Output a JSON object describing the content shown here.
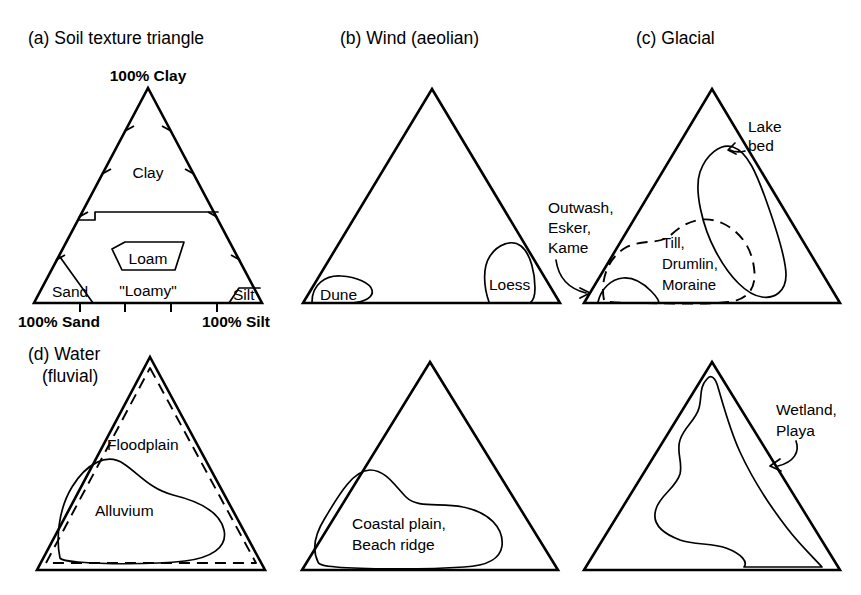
{
  "figure": {
    "background_color": "#ffffff",
    "line_color": "#000000",
    "type": "ternary-diagram-grid",
    "rows": 2,
    "columns": 3
  },
  "panels": {
    "a": {
      "title": "(a) Soil texture triangle",
      "apex_label": "100% Clay",
      "left_axis_label": "100% Sand",
      "right_axis_label": "100% Silt",
      "regions": [
        {
          "name": "clay",
          "label": "Clay"
        },
        {
          "name": "loam",
          "label": "Loam"
        },
        {
          "name": "loamy",
          "label": "\"Loamy\""
        },
        {
          "name": "sand",
          "label": "Sand"
        },
        {
          "name": "silt",
          "label": "Silt"
        }
      ],
      "tick_count_per_side": 4
    },
    "b": {
      "title": "(b) Wind (aeolian)",
      "regions": [
        {
          "name": "dune",
          "label": "Dune"
        },
        {
          "name": "loess",
          "label": "Loess"
        }
      ]
    },
    "c": {
      "title": "(c)  Glacial",
      "regions": [
        {
          "name": "lake-bed",
          "label": "Lake\nbed",
          "label_line_1": "Lake",
          "label_line_2": "bed",
          "style": "solid",
          "annotated": true
        },
        {
          "name": "outwash-esker-kame",
          "label_line_1": "Outwash,",
          "label_line_2": "Esker,",
          "label_line_3": "Kame",
          "style": "solid",
          "annotated": true
        },
        {
          "name": "till-drumlin-moraine",
          "label_line_1": "Till,",
          "label_line_2": "Drumlin,",
          "label_line_3": "Moraine",
          "style": "dashed",
          "annotated": false
        }
      ]
    },
    "d": {
      "title_line_1": "(d) Water",
      "title_line_2": "(fluvial)",
      "regions": [
        {
          "name": "floodplain",
          "label": "Floodplain",
          "style": "dashed"
        },
        {
          "name": "alluvium",
          "label": "Alluvium",
          "style": "solid"
        }
      ]
    },
    "e": {
      "title": "",
      "regions": [
        {
          "name": "coastal-plain-beach-ridge",
          "label_line_1": "Coastal plain,",
          "label_line_2": "Beach ridge",
          "style": "solid"
        }
      ]
    },
    "f": {
      "title": "",
      "regions": [
        {
          "name": "wetland-playa",
          "label_line_1": "Wetland,",
          "label_line_2": "Playa",
          "style": "solid",
          "annotated": true
        }
      ]
    }
  }
}
